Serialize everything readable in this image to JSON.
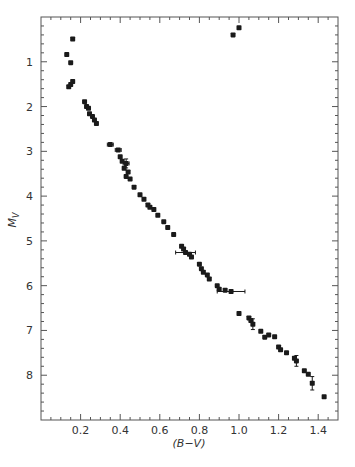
{
  "chart_data": {
    "type": "scatter",
    "title": "",
    "xlabel": "(B−V)",
    "ylabel": "M_V",
    "ylabel_main": "M",
    "ylabel_sub": "V",
    "xlim": [
      0.0,
      1.5
    ],
    "ylim": [
      0.0,
      9.0
    ],
    "y_inverted": true,
    "grid": false,
    "legend": null,
    "x_ticks": [
      0.2,
      0.4,
      0.6,
      0.8,
      1.0,
      1.2,
      1.4
    ],
    "x_tick_labels": [
      "0.2",
      "0.4",
      "0.6",
      "0.8",
      "1.0",
      "1.2",
      "1.4"
    ],
    "y_ticks": [
      1,
      2,
      3,
      4,
      5,
      6,
      7,
      8
    ],
    "y_tick_labels": [
      "1",
      "2",
      "3",
      "4",
      "5",
      "6",
      "7",
      "8"
    ],
    "marker_color": "#1a1a1a",
    "series": [
      {
        "name": "stars",
        "points": [
          {
            "x": 0.16,
            "y": 0.49
          },
          {
            "x": 0.13,
            "y": 0.84
          },
          {
            "x": 0.15,
            "y": 1.02
          },
          {
            "x": 0.16,
            "y": 1.44
          },
          {
            "x": 0.15,
            "y": 1.51
          },
          {
            "x": 0.14,
            "y": 1.56
          },
          {
            "x": 0.97,
            "y": 0.4
          },
          {
            "x": 1.0,
            "y": 0.24
          },
          {
            "x": 0.22,
            "y": 1.89
          },
          {
            "x": 0.23,
            "y": 2.0
          },
          {
            "x": 0.24,
            "y": 2.04
          },
          {
            "x": 0.245,
            "y": 2.16
          },
          {
            "x": 0.26,
            "y": 2.22
          },
          {
            "x": 0.27,
            "y": 2.3
          },
          {
            "x": 0.28,
            "y": 2.38
          },
          {
            "x": 0.35,
            "y": 2.85
          },
          {
            "x": 0.39,
            "y": 2.97
          },
          {
            "x": 0.4,
            "y": 3.12
          },
          {
            "x": 0.41,
            "y": 3.22
          },
          {
            "x": 0.43,
            "y": 3.27
          },
          {
            "x": 0.42,
            "y": 3.38
          },
          {
            "x": 0.44,
            "y": 3.46
          },
          {
            "x": 0.43,
            "y": 3.56
          },
          {
            "x": 0.45,
            "y": 3.62
          },
          {
            "x": 0.47,
            "y": 3.8
          },
          {
            "x": 0.5,
            "y": 3.97
          },
          {
            "x": 0.52,
            "y": 4.07
          },
          {
            "x": 0.54,
            "y": 4.2
          },
          {
            "x": 0.55,
            "y": 4.25
          },
          {
            "x": 0.57,
            "y": 4.3
          },
          {
            "x": 0.59,
            "y": 4.43
          },
          {
            "x": 0.62,
            "y": 4.57
          },
          {
            "x": 0.64,
            "y": 4.7
          },
          {
            "x": 0.67,
            "y": 4.86
          },
          {
            "x": 0.71,
            "y": 5.12
          },
          {
            "x": 0.72,
            "y": 5.18
          },
          {
            "x": 0.73,
            "y": 5.26
          },
          {
            "x": 0.75,
            "y": 5.3
          },
          {
            "x": 0.76,
            "y": 5.36
          },
          {
            "x": 0.8,
            "y": 5.52
          },
          {
            "x": 0.81,
            "y": 5.62
          },
          {
            "x": 0.82,
            "y": 5.7
          },
          {
            "x": 0.84,
            "y": 5.76
          },
          {
            "x": 0.85,
            "y": 5.85
          },
          {
            "x": 0.89,
            "y": 6.0
          },
          {
            "x": 0.9,
            "y": 6.08
          },
          {
            "x": 0.93,
            "y": 6.1
          },
          {
            "x": 0.96,
            "y": 6.13
          },
          {
            "x": 1.0,
            "y": 6.62
          },
          {
            "x": 1.05,
            "y": 6.72
          },
          {
            "x": 1.06,
            "y": 6.78
          },
          {
            "x": 1.07,
            "y": 6.86
          },
          {
            "x": 1.11,
            "y": 7.02
          },
          {
            "x": 1.13,
            "y": 7.15
          },
          {
            "x": 1.15,
            "y": 7.1
          },
          {
            "x": 1.18,
            "y": 7.14
          },
          {
            "x": 1.2,
            "y": 7.37
          },
          {
            "x": 1.21,
            "y": 7.43
          },
          {
            "x": 1.24,
            "y": 7.5
          },
          {
            "x": 1.28,
            "y": 7.62
          },
          {
            "x": 1.29,
            "y": 7.68
          },
          {
            "x": 1.33,
            "y": 7.9
          },
          {
            "x": 1.35,
            "y": 7.98
          },
          {
            "x": 1.37,
            "y": 8.18
          },
          {
            "x": 1.43,
            "y": 8.48
          }
        ]
      }
    ],
    "error_bars": [
      {
        "x": 0.35,
        "y": 2.85,
        "xerr": 0.015
      },
      {
        "x": 0.39,
        "y": 2.97,
        "xerr": 0.015
      },
      {
        "x": 0.43,
        "y": 3.27,
        "xerr": 0.015,
        "yerr": 0.1
      },
      {
        "x": 0.73,
        "y": 5.26,
        "xerr": 0.05
      },
      {
        "x": 0.96,
        "y": 6.13,
        "xerr": 0.07
      },
      {
        "x": 1.07,
        "y": 6.86,
        "yerr": 0.12
      },
      {
        "x": 1.29,
        "y": 7.68,
        "yerr": 0.12
      },
      {
        "x": 1.37,
        "y": 8.18,
        "yerr": 0.15
      }
    ]
  }
}
